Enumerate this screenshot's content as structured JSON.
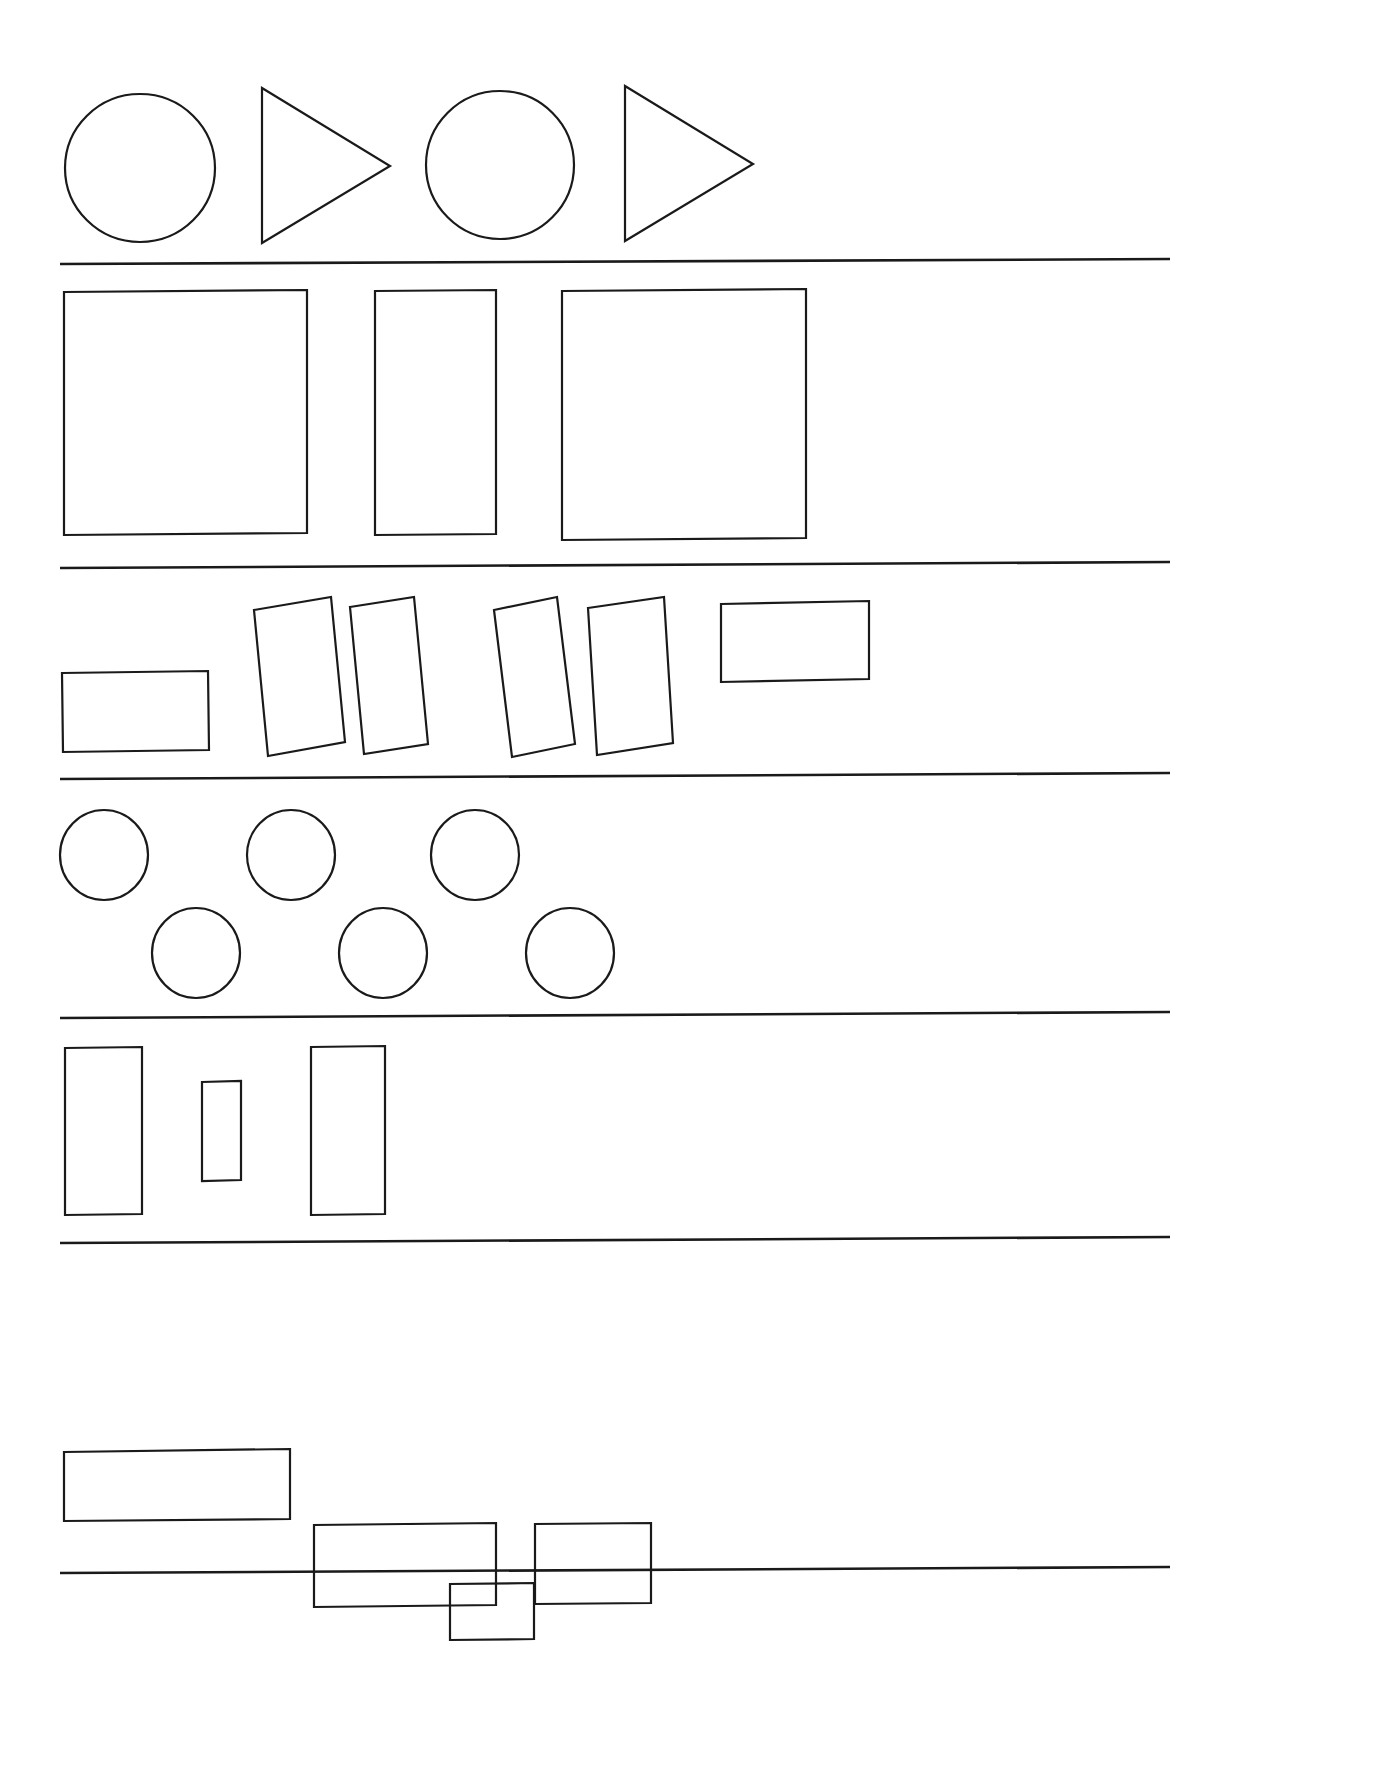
{
  "page": {
    "width": 1388,
    "height": 1789,
    "background_color": "#ffffff",
    "stroke_color": "#1a1a1a",
    "stroke_width": 2.2,
    "fill": "none"
  },
  "dividers": [
    {
      "name": "divider-1",
      "x1": 60,
      "y1": 264,
      "x2": 1170,
      "y2": 259
    },
    {
      "name": "divider-2",
      "x1": 60,
      "y1": 568,
      "x2": 1170,
      "y2": 562
    },
    {
      "name": "divider-3",
      "x1": 60,
      "y1": 779,
      "x2": 1170,
      "y2": 773
    },
    {
      "name": "divider-4",
      "x1": 60,
      "y1": 1018,
      "x2": 1170,
      "y2": 1012
    },
    {
      "name": "divider-5",
      "x1": 60,
      "y1": 1243,
      "x2": 1170,
      "y2": 1237
    },
    {
      "name": "divider-6",
      "x1": 60,
      "y1": 1573,
      "x2": 1170,
      "y2": 1567
    }
  ],
  "rows": [
    {
      "id": "row-1",
      "label": "circles-and-triangles",
      "shape_count": 4,
      "shapes": [
        {
          "name": "circle-1",
          "type": "ellipse",
          "cx": 140,
          "cy": 168,
          "rx": 75,
          "ry": 74
        },
        {
          "name": "triangle-1",
          "type": "polygon",
          "points": "262,88 390,166 262,243"
        },
        {
          "name": "circle-2",
          "type": "ellipse",
          "cx": 500,
          "cy": 165,
          "rx": 74,
          "ry": 74
        },
        {
          "name": "triangle-2",
          "type": "polygon",
          "points": "625,86 753,164 625,241"
        }
      ]
    },
    {
      "id": "row-2",
      "label": "large-upright-rectangles",
      "shape_count": 3,
      "shapes": [
        {
          "name": "rectangle-1",
          "type": "polygon",
          "points": "64,292 307,290 307,533 64,535"
        },
        {
          "name": "rectangle-2",
          "type": "polygon",
          "points": "375,291 496,290 496,534 375,535"
        },
        {
          "name": "rectangle-3",
          "type": "polygon",
          "points": "562,291 806,289 806,538 562,540"
        }
      ]
    },
    {
      "id": "row-3",
      "label": "tilted-rectangles",
      "shape_count": 6,
      "shapes": [
        {
          "name": "rectangle-flat-left",
          "type": "polygon",
          "points": "62,673 208,671 209,750 63,752"
        },
        {
          "name": "rectangle-tilted-1",
          "type": "polygon",
          "points": "254,610 331,597 345,742 268,756"
        },
        {
          "name": "rectangle-tilted-2",
          "type": "polygon",
          "points": "350,607 414,597 428,744 364,754"
        },
        {
          "name": "rectangle-tilted-3",
          "type": "polygon",
          "points": "494,610 557,597 575,744 512,757"
        },
        {
          "name": "rectangle-tilted-4",
          "type": "polygon",
          "points": "588,608 664,597 673,743 597,755"
        },
        {
          "name": "rectangle-flat-right",
          "type": "polygon",
          "points": "721,604 869,601 869,679 721,682"
        }
      ]
    },
    {
      "id": "row-4",
      "label": "circle-grid",
      "shape_count": 6,
      "shapes": [
        {
          "name": "circle-top-1",
          "type": "ellipse",
          "cx": 104,
          "cy": 855,
          "rx": 44,
          "ry": 45
        },
        {
          "name": "circle-top-2",
          "type": "ellipse",
          "cx": 291,
          "cy": 855,
          "rx": 44,
          "ry": 45
        },
        {
          "name": "circle-top-3",
          "type": "ellipse",
          "cx": 475,
          "cy": 855,
          "rx": 44,
          "ry": 45
        },
        {
          "name": "circle-bottom-1",
          "type": "ellipse",
          "cx": 196,
          "cy": 953,
          "rx": 44,
          "ry": 45
        },
        {
          "name": "circle-bottom-2",
          "type": "ellipse",
          "cx": 383,
          "cy": 953,
          "rx": 44,
          "ry": 45
        },
        {
          "name": "circle-bottom-3",
          "type": "ellipse",
          "cx": 570,
          "cy": 953,
          "rx": 44,
          "ry": 45
        }
      ]
    },
    {
      "id": "row-5",
      "label": "tall-narrow-rectangles",
      "shape_count": 3,
      "shapes": [
        {
          "name": "rectangle-tall-1",
          "type": "polygon",
          "points": "65,1048 142,1047 142,1214 65,1215"
        },
        {
          "name": "rectangle-small-2",
          "type": "polygon",
          "points": "202,1082 241,1081 241,1180 202,1181"
        },
        {
          "name": "rectangle-tall-3",
          "type": "polygon",
          "points": "311,1047 385,1046 385,1214 311,1215"
        }
      ]
    },
    {
      "id": "row-6",
      "label": "squares-descending",
      "shape_count": 4,
      "shapes": [
        {
          "name": "square-large",
          "type": "polygon",
          "points": "64,1452 290,1449 290,1518 290,1519 64,1521"
        },
        {
          "name": "square-medium",
          "type": "polygon",
          "points": "314,1607 496,1605 496,1523 314,1525"
        },
        {
          "name": "square-small",
          "type": "polygon",
          "points": "450,1640 534,1639 534,1583 450,1584"
        },
        {
          "name": "square-right",
          "type": "polygon",
          "points": "535,1604 651,1603 651,1523 535,1524"
        }
      ]
    }
  ]
}
